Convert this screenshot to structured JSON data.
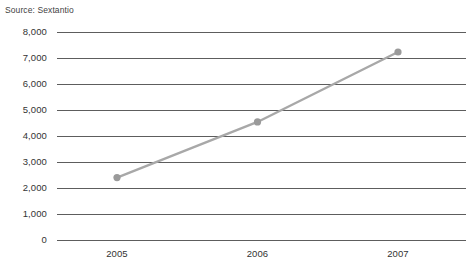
{
  "caption": {
    "source_text": "Source: Sextantio"
  },
  "chart_data": {
    "type": "line",
    "title": "",
    "subtitle": "",
    "xlabel": "",
    "ylabel": "",
    "categories": [
      "2005",
      "2006",
      "2007"
    ],
    "x": [
      2005,
      2006,
      2007
    ],
    "values": [
      2400,
      4540,
      7230
    ],
    "series": [
      {
        "name": "Series 1",
        "values": [
          2400,
          4540,
          7230
        ],
        "color": "#a8a8a8",
        "marker": "circle",
        "marker_color": "#9a9a9a"
      }
    ],
    "ylim": [
      0,
      8000
    ],
    "ytick_step": 1000,
    "ytick_labels": [
      "8,000",
      "7,000",
      "6,000",
      "5,000",
      "4,000",
      "3,000",
      "2,000",
      "1,000",
      "0"
    ],
    "ytick_values": [
      8000,
      7000,
      6000,
      5000,
      4000,
      3000,
      2000,
      1000,
      0
    ],
    "xtick_labels": [
      "2005",
      "2006",
      "2007"
    ],
    "grid": true,
    "grid_axis": "y",
    "grid_color": "#5d5d5d",
    "legend": false,
    "legend_position": "none",
    "background": "#ffffff"
  }
}
